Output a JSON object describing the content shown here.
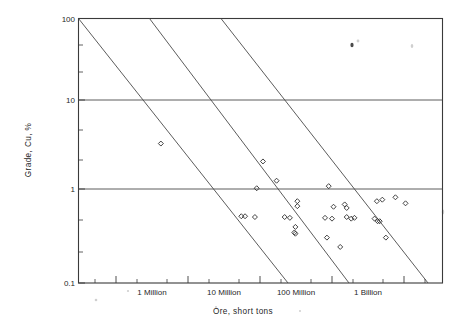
{
  "chart_data": {
    "type": "scatter",
    "title": "",
    "xlabel": "Ore, short tons",
    "ylabel": "Grade, Cu, %",
    "xscale": "log",
    "yscale": "log",
    "xlim": [
      200000,
      5000000000
    ],
    "ylim": [
      0.1,
      100
    ],
    "grid": true,
    "legend": false,
    "legend_position": "none",
    "x_tick_labels": [
      {
        "value": 1000000,
        "label": "1 Million"
      },
      {
        "value": 10000000,
        "label": "10 Million"
      },
      {
        "value": 100000000,
        "label": "100 Million"
      },
      {
        "value": 1000000000,
        "label": "1 Billion"
      }
    ],
    "y_tick_labels": [
      {
        "value": 100,
        "label": "100"
      },
      {
        "value": 10,
        "label": "10"
      },
      {
        "value": 1,
        "label": "1"
      },
      {
        "value": 0.1,
        "label": "0.1"
      }
    ],
    "gridlines_horizontal": [
      10,
      1
    ],
    "annotations": [
      {
        "type": "iso-line",
        "note": "constant contained copper, slope -1",
        "x_top": 200000,
        "y_top": 100,
        "x_bottom": 100000000,
        "y_bottom": 0.1
      },
      {
        "type": "iso-line",
        "note": "constant contained copper, slope -1",
        "x_top": 1000000,
        "y_top": 100,
        "x_bottom": 500000000,
        "y_bottom": 0.1
      },
      {
        "type": "iso-line",
        "note": "constant contained copper, slope -1",
        "x_top": 5000000,
        "y_top": 100,
        "x_bottom": 2500000000,
        "y_bottom": 0.1
      }
    ],
    "marker_style": "open-diamond",
    "series": [
      {
        "name": "Copper deposits",
        "points": [
          {
            "x": 420000,
            "y": 3.4
          },
          {
            "x": 11000000,
            "y": 2.1
          },
          {
            "x": 17000000,
            "y": 1.25
          },
          {
            "x": 9000000,
            "y": 1.02
          },
          {
            "x": 90000000,
            "y": 1.08
          },
          {
            "x": 33000000,
            "y": 0.72
          },
          {
            "x": 33000000,
            "y": 0.63
          },
          {
            "x": 105000000,
            "y": 0.62
          },
          {
            "x": 150000000,
            "y": 0.66
          },
          {
            "x": 160000000,
            "y": 0.6
          },
          {
            "x": 420000000,
            "y": 0.72
          },
          {
            "x": 500000000,
            "y": 0.75
          },
          {
            "x": 760000000,
            "y": 0.8
          },
          {
            "x": 1050000000,
            "y": 0.68
          },
          {
            "x": 5500000,
            "y": 0.48
          },
          {
            "x": 6200000,
            "y": 0.48
          },
          {
            "x": 8500000,
            "y": 0.47
          },
          {
            "x": 22000000,
            "y": 0.47
          },
          {
            "x": 26000000,
            "y": 0.46
          },
          {
            "x": 80000000,
            "y": 0.46
          },
          {
            "x": 100000000,
            "y": 0.45
          },
          {
            "x": 160000000,
            "y": 0.47
          },
          {
            "x": 185000000,
            "y": 0.45
          },
          {
            "x": 205000000,
            "y": 0.46
          },
          {
            "x": 390000000,
            "y": 0.45
          },
          {
            "x": 430000000,
            "y": 0.42
          },
          {
            "x": 460000000,
            "y": 0.42
          },
          {
            "x": 31000000,
            "y": 0.36
          },
          {
            "x": 30000000,
            "y": 0.31
          },
          {
            "x": 31000000,
            "y": 0.3
          },
          {
            "x": 85000000,
            "y": 0.27
          },
          {
            "x": 560000000,
            "y": 0.27
          },
          {
            "x": 130000000,
            "y": 0.21
          }
        ]
      }
    ]
  },
  "figure": {
    "x_axis_title": "Ore, short tons",
    "y_axis_title": "Grade, Cu, %"
  }
}
